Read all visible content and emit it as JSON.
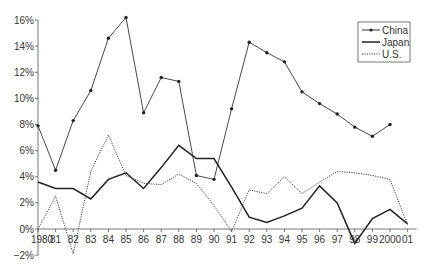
{
  "chart_data": {
    "type": "line",
    "title": "",
    "xlabel": "",
    "ylabel": "",
    "x": [
      "1980",
      "81",
      "82",
      "83",
      "84",
      "85",
      "86",
      "87",
      "88",
      "89",
      "90",
      "91",
      "92",
      "93",
      "94",
      "95",
      "96",
      "97",
      "98",
      "99",
      "2000",
      "01"
    ],
    "ylim": [
      -2,
      16
    ],
    "yticks": [
      -2,
      0,
      2,
      4,
      6,
      8,
      10,
      12,
      14,
      16
    ],
    "ytick_labels": [
      "−2%",
      "0%",
      "2%",
      "4%",
      "6%",
      "8%",
      "10%",
      "12%",
      "14%",
      "16%"
    ],
    "grid": false,
    "legend_position": "upper right",
    "series": [
      {
        "name": "China",
        "style": "solid-marker",
        "values": [
          7.9,
          4.5,
          8.3,
          10.6,
          14.6,
          16.2,
          8.9,
          11.6,
          11.3,
          4.1,
          3.8,
          9.2,
          14.3,
          13.5,
          12.8,
          10.5,
          9.6,
          8.8,
          7.8,
          7.1,
          8.0,
          null
        ]
      },
      {
        "name": "Japan",
        "style": "solid",
        "values": [
          3.6,
          3.1,
          3.1,
          2.3,
          3.8,
          4.3,
          3.1,
          4.7,
          6.4,
          5.4,
          5.4,
          3.2,
          0.9,
          0.5,
          1.0,
          1.6,
          3.3,
          2.0,
          -1.1,
          0.8,
          1.5,
          0.4
        ]
      },
      {
        "name": "U.S.",
        "style": "dotted",
        "values": [
          0.0,
          2.5,
          -1.9,
          4.4,
          7.2,
          4.1,
          3.5,
          3.4,
          4.2,
          3.5,
          1.8,
          -0.2,
          3.0,
          2.7,
          4.0,
          2.7,
          3.6,
          4.4,
          4.3,
          4.1,
          3.8,
          0.3
        ]
      }
    ]
  },
  "legend": {
    "items": [
      "China",
      "Japan",
      "U.S."
    ]
  },
  "colors": {
    "line": "#333333",
    "axis": "#555555",
    "background": "#ffffff"
  }
}
